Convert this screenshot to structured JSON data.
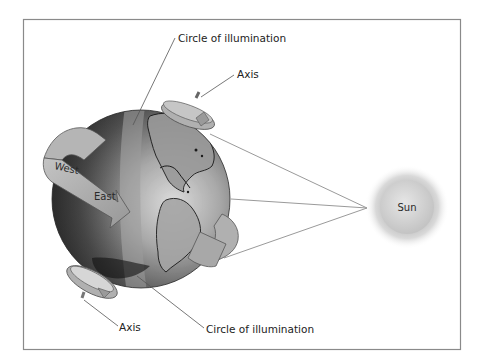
{
  "diagram": {
    "labels": {
      "circle_top": "Circle of illumination",
      "circle_bottom": "Circle of illumination",
      "axis_top": "Axis",
      "axis_bottom": "Axis",
      "west": "West",
      "east": "East",
      "sun": "Sun"
    },
    "elements": {
      "earth": "globe showing North and South America",
      "rotation_arrow": "west-to-east rotation arrow",
      "axis_arrows": "rotation arrows around the polar axis",
      "sun_rays": 3
    },
    "colors": {
      "frame": "#8a8a8a",
      "earth_light": "#d4d4d4",
      "earth_dark": "#2e2e2e",
      "arrow_fill": "#a9a9a9",
      "ray": "#9a9a9a",
      "sun_core": "#d8d8d8",
      "sun_glow": "#bdbdbd"
    }
  }
}
